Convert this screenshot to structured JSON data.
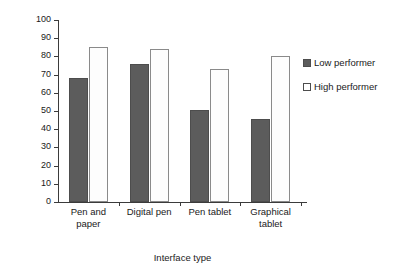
{
  "chart_data": {
    "type": "bar",
    "title": "",
    "xlabel": "Interface type",
    "ylabel": "Percent correct inferences",
    "categories": [
      "Pen and paper",
      "Digital pen",
      "Pen tablet",
      "Graphical tablet"
    ],
    "category_lines": [
      [
        "Pen and",
        "paper"
      ],
      [
        "Digital pen"
      ],
      [
        "Pen tablet"
      ],
      [
        "Graphical",
        "tablet"
      ]
    ],
    "series": [
      {
        "name": "Low performer",
        "values": [
          68,
          76,
          50.5,
          45.5
        ],
        "color": "#5c5c5c"
      },
      {
        "name": "High performer",
        "values": [
          85,
          84,
          73,
          80
        ],
        "color": "#ffffff"
      }
    ],
    "ylim": [
      0,
      100
    ],
    "yticks": [
      0,
      10,
      20,
      30,
      40,
      50,
      60,
      70,
      80,
      90,
      100
    ],
    "ytick_labels": [
      "0",
      "10",
      "20",
      "30",
      "40",
      "50",
      "60",
      "70",
      "80",
      "90",
      "100"
    ],
    "grid": false,
    "legend_position": "right"
  },
  "axes": {
    "y_title": "Percent correct inferences",
    "x_title": "Interface type"
  },
  "legend": {
    "items": [
      {
        "label": "Low performer",
        "swatch": "filled-dark-square"
      },
      {
        "label": "High performer",
        "swatch": "open-white-square"
      }
    ]
  },
  "ticks": {
    "y": [
      "0",
      "10",
      "20",
      "30",
      "40",
      "50",
      "60",
      "70",
      "80",
      "90",
      "100"
    ]
  }
}
